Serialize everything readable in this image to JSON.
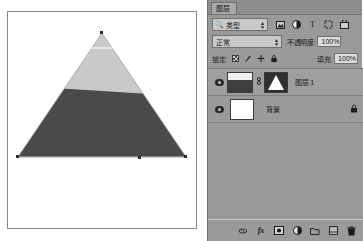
{
  "canvas": {
    "name": "document-canvas",
    "shape": "triangle-with-gradient-mask",
    "upper_color": "#c9c9c9",
    "lower_color": "#4a4a4a",
    "background": "#ffffff",
    "selection_handles": 4
  },
  "panel": {
    "tab_label": "图层",
    "filter": {
      "icon": "search-icon",
      "label": "类型",
      "stepper": "↕",
      "icons": [
        {
          "name": "filter-pixel-icon",
          "glyph": "▣"
        },
        {
          "name": "filter-adjustment-icon",
          "glyph": "◐"
        },
        {
          "name": "filter-type-icon",
          "glyph": "T"
        },
        {
          "name": "filter-shape-icon",
          "glyph": "⬚"
        },
        {
          "name": "filter-smartobject-icon",
          "glyph": "⚭"
        }
      ]
    },
    "blend": {
      "mode": "正常",
      "stepper": "↕",
      "opacity_label": "不透明度:",
      "opacity_value": "100%"
    },
    "lock": {
      "label": "锁定:",
      "icons": [
        {
          "name": "lock-transparent-pixels-icon",
          "glyph": ""
        },
        {
          "name": "lock-image-pixels-icon",
          "glyph": "╱"
        },
        {
          "name": "lock-position-icon",
          "glyph": "✚"
        },
        {
          "name": "lock-all-icon",
          "glyph": "⚿"
        }
      ],
      "fill_label": "填充:",
      "fill_value": "100%"
    },
    "layers": [
      {
        "name": "图层 1",
        "visible": true,
        "selected": true,
        "linked": true,
        "has_mask": true,
        "locked": false,
        "chain_glyph": "⛓"
      },
      {
        "name": "背景",
        "visible": true,
        "selected": false,
        "linked": false,
        "has_mask": false,
        "locked": true,
        "lock_glyph": "⚿"
      }
    ],
    "bottom_bar": [
      {
        "name": "link-layers-button",
        "glyph": "⚭"
      },
      {
        "name": "layer-style-button",
        "glyph": "fx"
      },
      {
        "name": "add-layer-mask-button",
        "glyph": "▣"
      },
      {
        "name": "new-adjustment-layer-button",
        "glyph": "◐"
      },
      {
        "name": "new-group-button",
        "glyph": "🗀"
      },
      {
        "name": "new-layer-button",
        "glyph": "⬚"
      },
      {
        "name": "delete-layer-button",
        "glyph": "🗑"
      }
    ]
  }
}
